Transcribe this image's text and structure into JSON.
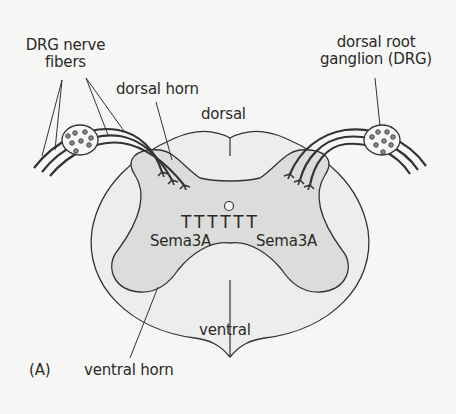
{
  "figure": {
    "panel_label": "(A)",
    "colors": {
      "background": "#f6f6f4",
      "white_matter": "#ededeb",
      "gray_matter": "#dcdcda",
      "outline": "#333333",
      "dot": "#7a7a7a"
    }
  },
  "labels": {
    "drg_nerve_fibers_line1": "DRG nerve",
    "drg_nerve_fibers_line2": "fibers",
    "dorsal_horn": "dorsal horn",
    "dorsal": "dorsal",
    "drg_line1": "dorsal root",
    "drg_line2": "ganglion (DRG)",
    "sema_left": "Sema3A",
    "sema_right": "Sema3A",
    "sema_markers": "TTTTTT",
    "ventral": "ventral",
    "ventral_horn": "ventral horn"
  }
}
